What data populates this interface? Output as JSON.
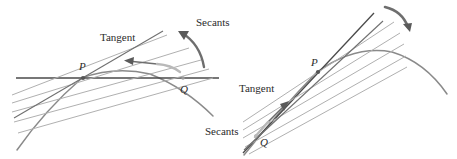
{
  "figure": {
    "background_color": "#ffffff",
    "width": 457,
    "height": 159,
    "colors": {
      "curve": "#8a8a8a",
      "tangent": "#4a4a4a",
      "secant": "#b0b0b0",
      "arrow": "#6e6e6e",
      "text": "#2b2b2b"
    }
  },
  "panels": [
    {
      "id": "left",
      "name": "horizontal-tangent-panel",
      "labels": {
        "tangent": "Tangent",
        "secants": "Secants",
        "point_p": "P",
        "point_q": "Q"
      },
      "description": "Curve with horizontal tangent line at P; secant lines through P and Q fan out; arrow shows Q sliding toward P and secants rotating to the tangent."
    },
    {
      "id": "right",
      "name": "steep-tangent-panel",
      "labels": {
        "tangent": "Tangent",
        "secants": "Secants",
        "point_p": "P",
        "point_q": "Q"
      },
      "description": "Rotated view: curve with a steeply sloped tangent line at P; secants from Q below-left rotate upward toward the tangent."
    }
  ]
}
